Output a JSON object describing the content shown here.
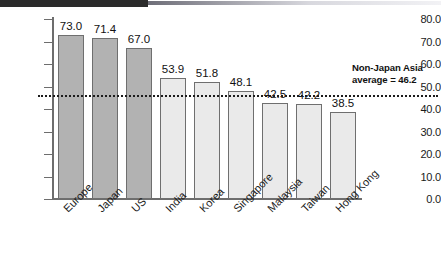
{
  "chart_data": {
    "type": "bar",
    "title": "",
    "subtitle": "",
    "xlabel": "",
    "ylabel": "",
    "ylim": [
      0.0,
      80.0
    ],
    "ytick_labels": [
      "80.0",
      "70.0",
      "60.0",
      "50.0",
      "40.0",
      "30.0",
      "20.0",
      "10.0",
      "0.0"
    ],
    "ytick_values": [
      80.0,
      70.0,
      60.0,
      50.0,
      40.0,
      30.0,
      20.0,
      10.0,
      0.0
    ],
    "grid": false,
    "legend": "none",
    "categories": [
      "Europe",
      "Japan",
      "US",
      "India",
      "Korea",
      "Singapore",
      "Malaysia",
      "Taiwan",
      "Hong Kong"
    ],
    "values": [
      73.0,
      71.4,
      67.0,
      53.9,
      51.8,
      48.1,
      42.5,
      42.2,
      38.5
    ],
    "value_labels": [
      "73.0",
      "71.4",
      "67.0",
      "53.9",
      "51.8",
      "48.1",
      "42.5",
      "42.2",
      "38.5"
    ],
    "bar_groups": [
      "dark",
      "dark",
      "dark",
      "light",
      "light",
      "light",
      "light",
      "light",
      "light"
    ],
    "bar_colors": {
      "dark": "#b2b2b2",
      "light": "#eaeaea",
      "edge": "#6f6f6f"
    },
    "reference_line": {
      "value": 46.2,
      "style": "dotted",
      "color": "#1c1c1c",
      "label_line1": "Non-Japan Asia",
      "label_line2": "average = 46.2"
    }
  },
  "annotation": {
    "line1": "Non-Japan Asia",
    "line2": "average = 46.2"
  }
}
